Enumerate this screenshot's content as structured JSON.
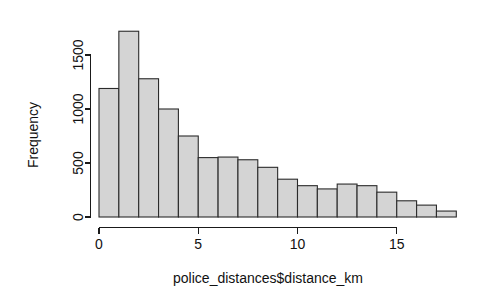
{
  "chart_data": {
    "type": "bar",
    "title": "",
    "subtitle": "",
    "xlabel": "police_distances$distance_km",
    "ylabel": "Frequency",
    "grid": false,
    "legend": false,
    "legend_position": "none",
    "bin_width": 1,
    "bin_starts": [
      0,
      1,
      2,
      3,
      4,
      5,
      6,
      7,
      8,
      9,
      10,
      11,
      12,
      13,
      14,
      15,
      16,
      17
    ],
    "categories": [
      "0-1",
      "1-2",
      "2-3",
      "3-4",
      "4-5",
      "5-6",
      "6-7",
      "7-8",
      "8-9",
      "9-10",
      "10-11",
      "11-12",
      "12-13",
      "13-14",
      "14-15",
      "15-16",
      "16-17",
      "17-18"
    ],
    "values": [
      1190,
      1720,
      1280,
      1000,
      750,
      550,
      555,
      530,
      460,
      350,
      290,
      260,
      305,
      290,
      230,
      150,
      110,
      55
    ],
    "xlim": [
      0,
      18
    ],
    "ylim": [
      0,
      1750
    ],
    "xticks": [
      0,
      5,
      10,
      15
    ],
    "xtick_labels": [
      "0",
      "5",
      "10",
      "15"
    ],
    "yticks": [
      0,
      500,
      1000,
      1500
    ],
    "ytick_labels": [
      "0",
      "500",
      "1000",
      "1500"
    ],
    "bar_fill": "#d4d4d4",
    "bar_stroke": "#2b2b2b",
    "axis_color": "#1a1a1a",
    "background": "#ffffff"
  },
  "labels": {
    "x_axis_title": "police_distances$distance_km",
    "y_axis_title": "Frequency"
  }
}
